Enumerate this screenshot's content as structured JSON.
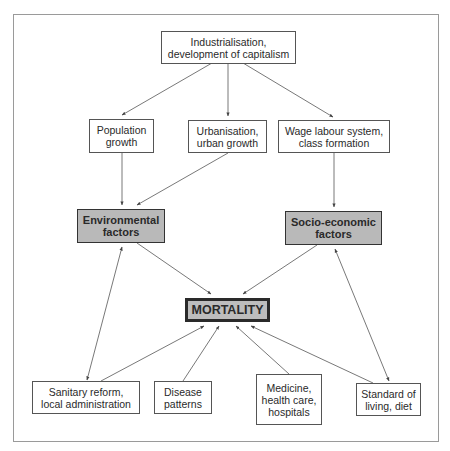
{
  "diagram": {
    "nodes": {
      "industrialisation": {
        "label": "Industrialisation,\ndevelopment of capitalism"
      },
      "population": {
        "label": "Population\ngrowth"
      },
      "urbanisation": {
        "label": "Urbanisation,\nurban growth"
      },
      "wage": {
        "label": "Wage labour system,\nclass formation"
      },
      "environmental": {
        "label": "Environmental\nfactors"
      },
      "socioeconomic": {
        "label": "Socio-economic\nfactors"
      },
      "mortality": {
        "label": "MORTALITY"
      },
      "sanitary": {
        "label": "Sanitary reform,\nlocal administration"
      },
      "disease": {
        "label": "Disease\npatterns"
      },
      "medicine": {
        "label": "Medicine,\nhealth care,\nhospitals"
      },
      "standard": {
        "label": "Standard of\nliving, diet"
      }
    },
    "edges": [
      {
        "from": "industrialisation",
        "to": "population",
        "type": "one-way"
      },
      {
        "from": "industrialisation",
        "to": "urbanisation",
        "type": "one-way"
      },
      {
        "from": "industrialisation",
        "to": "wage",
        "type": "one-way"
      },
      {
        "from": "population",
        "to": "environmental",
        "type": "one-way"
      },
      {
        "from": "urbanisation",
        "to": "environmental",
        "type": "one-way"
      },
      {
        "from": "wage",
        "to": "socioeconomic",
        "type": "one-way"
      },
      {
        "from": "environmental",
        "to": "mortality",
        "type": "one-way"
      },
      {
        "from": "socioeconomic",
        "to": "mortality",
        "type": "one-way"
      },
      {
        "from": "sanitary",
        "to": "environmental",
        "type": "two-way"
      },
      {
        "from": "sanitary",
        "to": "mortality",
        "type": "one-way"
      },
      {
        "from": "disease",
        "to": "mortality",
        "type": "one-way"
      },
      {
        "from": "medicine",
        "to": "mortality",
        "type": "one-way"
      },
      {
        "from": "standard",
        "to": "mortality",
        "type": "one-way"
      },
      {
        "from": "standard",
        "to": "socioeconomic",
        "type": "two-way"
      }
    ],
    "colors": {
      "factor_fill": "#b9b9b9",
      "mortality_fill": "#bdbdbd",
      "border": "#333333",
      "frame": "#9a9a9a"
    }
  }
}
